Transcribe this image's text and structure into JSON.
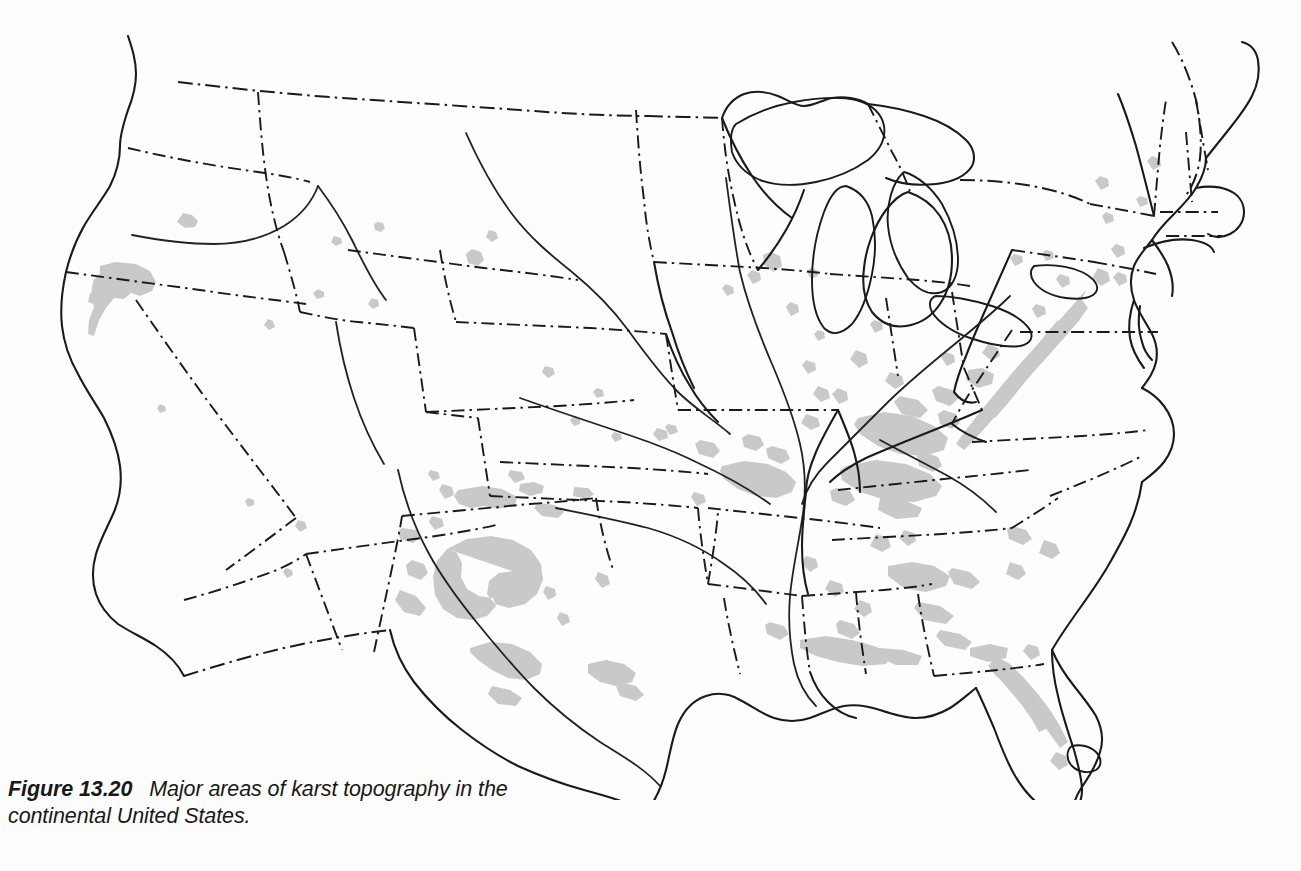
{
  "figure": {
    "label": "Figure 13.20",
    "caption": "Major areas of karst topography in the continental United States."
  },
  "map": {
    "title": "Major areas of karst topography in the continental United States",
    "region": "Continental United States",
    "projection_note": "conic",
    "legend_shown": false,
    "colors": {
      "karst_fill": "#c9c9c9",
      "outline": "#1a1a1a",
      "background": "#fdfdfd"
    },
    "line_styles": {
      "national_border": "dash-dot",
      "state_boundary": "dash-dot",
      "coastline": "solid",
      "lakes": "solid",
      "rivers": "solid"
    },
    "karst_regions": [
      "Northern California / Klamath",
      "Central Oregon / Idaho border",
      "Black Hills, South Dakota",
      "Edwards Plateau, Texas",
      "Guadalupe and Pecos, New Mexico",
      "Llano Estacado margin, Texas",
      "Ozark Plateau, Missouri and Arkansas",
      "Mammoth Cave region, Kentucky",
      "Central Basin, Tennessee",
      "Valley and Ridge, Appalachians",
      "Shenandoah Valley, Virginia",
      "Cumberland Plateau margin",
      "Northern Alabama and Georgia",
      "Florida peninsula and panhandle",
      "Driftless Area, Wisconsin and Iowa",
      "Central Pennsylvania",
      "Western New York and Vermont"
    ]
  }
}
